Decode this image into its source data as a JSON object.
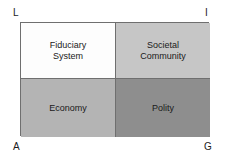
{
  "diagram": {
    "type": "agil-2x2-matrix",
    "corner_labels": [
      {
        "key": "L",
        "text": "L",
        "position": "top-left"
      },
      {
        "key": "I",
        "text": "I",
        "position": "top-right"
      },
      {
        "key": "A",
        "text": "A",
        "position": "bottom-left"
      },
      {
        "key": "G",
        "text": "G",
        "position": "bottom-right"
      }
    ],
    "cells": [
      {
        "key": "fiduciary-system",
        "label": "Fiduciary\nSystem",
        "quadrant": "top-left",
        "fill": "#fdfdfd"
      },
      {
        "key": "societal-community",
        "label": "Societal\nCommunity",
        "quadrant": "top-right",
        "fill": "#c6c6c6"
      },
      {
        "key": "economy",
        "label": "Economy",
        "quadrant": "bottom-left",
        "fill": "#b4b4b4"
      },
      {
        "key": "polity",
        "label": "Polity",
        "quadrant": "bottom-right",
        "fill": "#8e8e8e"
      }
    ],
    "border_color": "#6f6f6f",
    "text_color": "#1a1a1a",
    "background": "#ffffff"
  }
}
